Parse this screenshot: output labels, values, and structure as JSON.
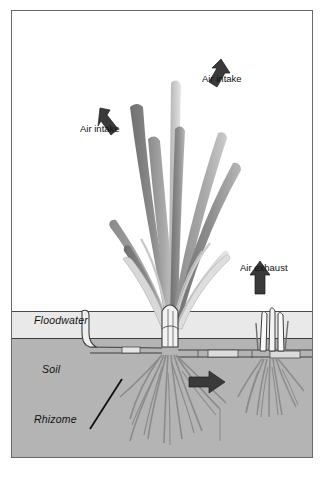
{
  "figure": {
    "layers": [
      {
        "key": "floodwater",
        "label": "Floodwater",
        "color": "#e9e9e9"
      },
      {
        "key": "soil",
        "label": "Soil",
        "color": "#b4b4b4"
      },
      {
        "key": "rhizome",
        "label": "Rhizome",
        "color": "#b4b4b4"
      }
    ],
    "annotations": [
      {
        "key": "air_intake_right",
        "label": "Air intake",
        "arrow": "down-left-arrow"
      },
      {
        "key": "air_intake_left",
        "label": "Air intake",
        "arrow": "down-right-arrow"
      },
      {
        "key": "air_exhaust",
        "label": "Air exhaust",
        "arrow": "up-arrow"
      },
      {
        "key": "soil_flow",
        "label": "",
        "arrow": "right-arrow"
      }
    ],
    "colors": {
      "frame_border": "#6a6a6a",
      "floodwater": "#e9e9e9",
      "soil": "#b4b4b4",
      "arrow_dark": "#3a3a3a",
      "leaf_dark": "#7d7d7d",
      "leaf_mid": "#9a9a9a",
      "leaf_light": "#c4c4c4",
      "root": "#8b8b8b",
      "text": "#111111",
      "background": "#ffffff"
    }
  }
}
